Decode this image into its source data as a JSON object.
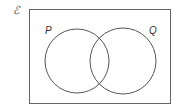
{
  "diagram": {
    "type": "venn",
    "universal_set": {
      "label": "ℰ"
    },
    "sets": [
      {
        "label": "P",
        "cx": 77,
        "cy": 61,
        "r": 32
      },
      {
        "label": "Q",
        "cx": 123,
        "cy": 61,
        "r": 33
      }
    ],
    "colors": {
      "stroke": "#555555",
      "background": "#ffffff"
    }
  }
}
